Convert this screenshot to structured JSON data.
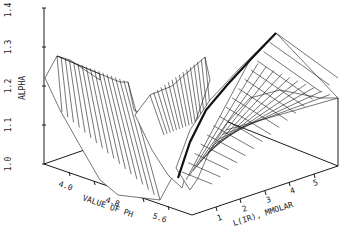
{
  "chart_data": {
    "type": "surface3d",
    "title": "",
    "zlabel": "ALPHA",
    "xlabel": "VALUE OF PH",
    "ylabel": "L(IR), MMOLAR",
    "z_ticks": [
      "1.0",
      "1.1",
      "1.2",
      "1.3",
      "1.4"
    ],
    "x_ticks": [
      "4.0",
      "4.8",
      "5.6"
    ],
    "y_ticks": [
      "1",
      "2",
      "3",
      "4",
      "5"
    ],
    "zlim": [
      1.0,
      1.4
    ],
    "xlim": [
      3.6,
      6.0
    ],
    "ylim": [
      0,
      6
    ],
    "grid": false,
    "legend": null,
    "surface_samples": [
      {
        "ph": 3.6,
        "l_ir": 0.0,
        "alpha": 1.24
      },
      {
        "ph": 3.8,
        "l_ir": 0.0,
        "alpha": 1.29
      },
      {
        "ph": 4.4,
        "l_ir": 0.0,
        "alpha": 1.27
      },
      {
        "ph": 4.8,
        "l_ir": 0.0,
        "alpha": 1.26
      },
      {
        "ph": 5.2,
        "l_ir": 0.0,
        "alpha": 1.08
      },
      {
        "ph": 5.6,
        "l_ir": 0.0,
        "alpha": 1.02
      },
      {
        "ph": 4.8,
        "l_ir": 1.0,
        "alpha": 1.02
      },
      {
        "ph": 5.6,
        "l_ir": 1.0,
        "alpha": 1.2
      },
      {
        "ph": 6.0,
        "l_ir": 3.0,
        "alpha": 1.3
      },
      {
        "ph": 6.0,
        "l_ir": 6.0,
        "alpha": 1.35
      }
    ]
  },
  "axes": {
    "alpha_label": "ALPHA",
    "ph_label": "VALUE OF PH",
    "lir_label": "L(IR), MMOLAR",
    "alpha_ticks": [
      "1.0",
      "1.1",
      "1.2",
      "1.3",
      "1.4"
    ],
    "ph_ticks": [
      "4.0",
      "4.8",
      "5.6"
    ],
    "lir_ticks": [
      "1",
      "2",
      "3",
      "4",
      "5"
    ]
  }
}
